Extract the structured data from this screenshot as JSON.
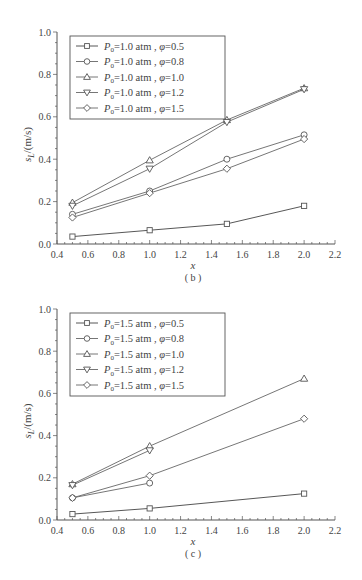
{
  "chart_data": [
    {
      "type": "line",
      "panel_label": "( b )",
      "title": "",
      "xlabel": "x",
      "ylabel": "s_L/(m/s)",
      "xlim": [
        0.4,
        2.2
      ],
      "ylim": [
        0.0,
        1.0
      ],
      "xticks": [
        "0.4",
        "0.6",
        "0.8",
        "1.0",
        "1.2",
        "1.4",
        "1.6",
        "1.8",
        "2.0",
        "2.2"
      ],
      "yticks": [
        "0.0",
        "0.2",
        "0.4",
        "0.6",
        "0.8",
        "1.0"
      ],
      "grid": false,
      "legend_position": "upper left",
      "x": [
        0.5,
        1.0,
        1.5,
        2.0
      ],
      "series": [
        {
          "name": "P0=1.0 atm, φ=0.5",
          "marker": "square",
          "values": [
            0.035,
            0.065,
            0.095,
            0.18
          ]
        },
        {
          "name": "P0=1.0 atm, φ=0.8",
          "marker": "circle",
          "values": [
            0.14,
            0.25,
            0.4,
            0.515
          ]
        },
        {
          "name": "P0=1.0 atm, φ=1.0",
          "marker": "triangle-up",
          "values": [
            0.195,
            0.395,
            0.585,
            0.735
          ]
        },
        {
          "name": "P0=1.0 atm, φ=1.2",
          "marker": "triangle-down",
          "values": [
            0.18,
            0.355,
            0.575,
            0.73
          ]
        },
        {
          "name": "P0=1.0 atm, φ=1.5",
          "marker": "diamond",
          "values": [
            0.125,
            0.24,
            0.355,
            0.495
          ]
        }
      ]
    },
    {
      "type": "line",
      "panel_label": "( c )",
      "title": "",
      "xlabel": "x",
      "ylabel": "s_L/(m/s)",
      "xlim": [
        0.4,
        2.2
      ],
      "ylim": [
        0.0,
        1.0
      ],
      "xticks": [
        "0.4",
        "0.6",
        "0.8",
        "1.0",
        "1.2",
        "1.4",
        "1.6",
        "1.8",
        "2.0",
        "2.2"
      ],
      "yticks": [
        "0.0",
        "0.2",
        "0.4",
        "0.6",
        "0.8",
        "1.0"
      ],
      "grid": false,
      "legend_position": "upper left",
      "x": [
        0.5,
        1.0,
        2.0
      ],
      "series": [
        {
          "name": "P0=1.5 atm, φ=0.5",
          "marker": "square",
          "values": [
            0.028,
            0.055,
            0.125
          ]
        },
        {
          "name": "P0=1.5 atm, φ=0.8",
          "marker": "circle",
          "values": [
            0.105,
            0.175,
            null
          ]
        },
        {
          "name": "P0=1.5 atm, φ=1.0",
          "marker": "triangle-up",
          "values": [
            0.17,
            0.35,
            0.67
          ]
        },
        {
          "name": "P0=1.5 atm, φ=1.2",
          "marker": "triangle-down",
          "values": [
            0.165,
            0.33,
            null
          ]
        },
        {
          "name": "P0=1.5 atm, φ=1.5",
          "marker": "diamond",
          "values": [
            0.105,
            0.21,
            0.48
          ]
        }
      ]
    }
  ],
  "panels": {
    "b": {
      "caption": "( b )",
      "xlabel": "x",
      "ylabel_main": "s",
      "ylabel_sub": "L",
      "ylabel_unit": "/(m/s)",
      "legend": [
        {
          "p": "P",
          "psub": "0",
          "text": "=1.0 atm , ",
          "phi": "φ",
          "val": "=0.5"
        },
        {
          "p": "P",
          "psub": "0",
          "text": "=1.0 atm , ",
          "phi": "φ",
          "val": "=0.8"
        },
        {
          "p": "P",
          "psub": "0",
          "text": "=1.0 atm , ",
          "phi": "φ",
          "val": "=1.0"
        },
        {
          "p": "P",
          "psub": "0",
          "text": "=1.0 atm , ",
          "phi": "φ",
          "val": "=1.2"
        },
        {
          "p": "P",
          "psub": "0",
          "text": "=1.0 atm , ",
          "phi": "φ",
          "val": "=1.5"
        }
      ]
    },
    "c": {
      "caption": "( c )",
      "xlabel": "x",
      "ylabel_main": "s",
      "ylabel_sub": "L",
      "ylabel_unit": "/(m/s)",
      "legend": [
        {
          "p": "P",
          "psub": "0",
          "text": "=1.5 atm , ",
          "phi": "φ",
          "val": "=0.5"
        },
        {
          "p": "P",
          "psub": "0",
          "text": "=1.5 atm , ",
          "phi": "φ",
          "val": "=0.8"
        },
        {
          "p": "P",
          "psub": "0",
          "text": "=1.5 atm , ",
          "phi": "φ",
          "val": "=1.0"
        },
        {
          "p": "P",
          "psub": "0",
          "text": "=1.5 atm , ",
          "phi": "φ",
          "val": "=1.2"
        },
        {
          "p": "P",
          "psub": "0",
          "text": "=1.5 atm , ",
          "phi": "φ",
          "val": "=1.5"
        }
      ]
    }
  },
  "colors": {
    "axis": "#555555",
    "line": "#666666",
    "marker_stroke": "#555555",
    "marker_fill": "#ffffff",
    "text": "#444444"
  }
}
